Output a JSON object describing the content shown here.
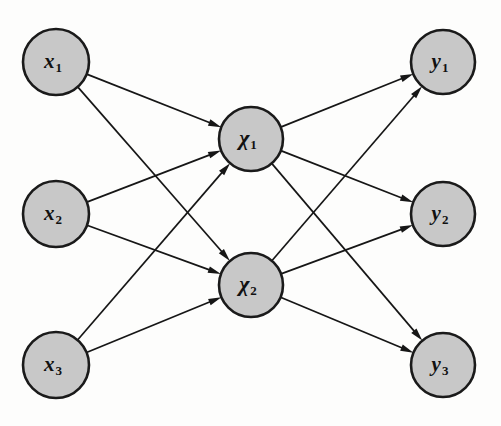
{
  "diagram": {
    "kind": "feedforward-neural-network",
    "background_color": "#fdfdfc",
    "node_fill_color": "#c8c8c8",
    "node_stroke_color": "#1a1a1a",
    "edge_color": "#161616",
    "node_radius": 32,
    "layers": [
      {
        "id": "input",
        "name": "input-layer",
        "nodes": [
          {
            "id": "x1",
            "base": "x",
            "sub": "1",
            "script": "latin",
            "cx": 56,
            "cy": 62,
            "r": 33
          },
          {
            "id": "x2",
            "base": "x",
            "sub": "2",
            "script": "latin",
            "cx": 56,
            "cy": 214,
            "r": 33
          },
          {
            "id": "x3",
            "base": "x",
            "sub": "3",
            "script": "latin",
            "cx": 56,
            "cy": 365,
            "r": 33
          }
        ]
      },
      {
        "id": "hidden",
        "name": "hidden-layer",
        "nodes": [
          {
            "id": "chi1",
            "base": "χ",
            "sub": "1",
            "script": "greek",
            "cx": 251,
            "cy": 139,
            "r": 32
          },
          {
            "id": "chi2",
            "base": "χ",
            "sub": "2",
            "script": "greek",
            "cx": 251,
            "cy": 285,
            "r": 32
          }
        ]
      },
      {
        "id": "output",
        "name": "output-layer",
        "nodes": [
          {
            "id": "y1",
            "base": "y",
            "sub": "1",
            "script": "latin",
            "cx": 443,
            "cy": 62,
            "r": 32
          },
          {
            "id": "y2",
            "base": "y",
            "sub": "2",
            "script": "latin",
            "cx": 443,
            "cy": 214,
            "r": 32
          },
          {
            "id": "y3",
            "base": "y",
            "sub": "3",
            "script": "latin",
            "cx": 443,
            "cy": 365,
            "r": 32
          }
        ]
      }
    ],
    "edges": [
      {
        "from": "x1",
        "to": "chi1"
      },
      {
        "from": "x1",
        "to": "chi2"
      },
      {
        "from": "x2",
        "to": "chi1"
      },
      {
        "from": "x2",
        "to": "chi2"
      },
      {
        "from": "x3",
        "to": "chi1"
      },
      {
        "from": "x3",
        "to": "chi2"
      },
      {
        "from": "chi1",
        "to": "y1"
      },
      {
        "from": "chi1",
        "to": "y2"
      },
      {
        "from": "chi1",
        "to": "y3"
      },
      {
        "from": "chi2",
        "to": "y1"
      },
      {
        "from": "chi2",
        "to": "y2"
      },
      {
        "from": "chi2",
        "to": "y3"
      }
    ],
    "arrow": {
      "length": 13,
      "half_width": 3.4
    }
  }
}
